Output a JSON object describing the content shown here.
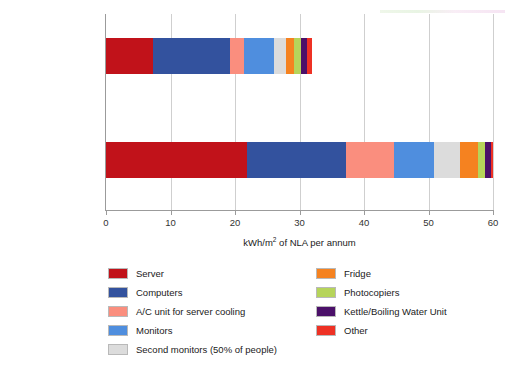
{
  "chart_data": {
    "type": "bar",
    "orientation": "horizontal",
    "stacked": true,
    "title": "",
    "xlabel": "kWh/m2 of NLA per annum",
    "xlabel_parts": {
      "pre": "kWh/m",
      "sup": "2",
      "post": " of NLA per annum"
    },
    "ylabel": "",
    "categories": [
      "Working hours only",
      "Total hours"
    ],
    "xlim": [
      0,
      60
    ],
    "xticks": [
      0,
      10,
      20,
      30,
      40,
      50,
      60
    ],
    "xticklabels": [
      "0",
      "10",
      "20",
      "30",
      "40",
      "50",
      "60"
    ],
    "grid": true,
    "legend_position": "bottom",
    "series": [
      {
        "name": "Server",
        "color": "#c1121a",
        "values": [
          7.3,
          21.9
        ]
      },
      {
        "name": "Computers",
        "color": "#33529e",
        "values": [
          11.9,
          15.3
        ]
      },
      {
        "name": "A/C unit for server cooling",
        "color": "#fa8e7e",
        "values": [
          2.2,
          7.5
        ]
      },
      {
        "name": "Monitors",
        "color": "#4f8ede",
        "values": [
          4.6,
          6.2
        ]
      },
      {
        "name": "Second monitors (50% of people)",
        "color": "#dcdcdc",
        "values": [
          1.9,
          4.0
        ]
      },
      {
        "name": "Fridge",
        "color": "#f58220",
        "values": [
          1.2,
          2.8
        ]
      },
      {
        "name": "Photocopiers",
        "color": "#b6d45a",
        "values": [
          1.1,
          1.1
        ]
      },
      {
        "name": "Kettle/Boiling Water Unit",
        "color": "#4b1069",
        "values": [
          1.0,
          0.9
        ]
      },
      {
        "name": "Other",
        "color": "#ee3124",
        "values": [
          0.7,
          0.3
        ]
      }
    ],
    "totals": [
      31.9,
      60.0
    ]
  },
  "legend": {
    "left_column": [
      {
        "label": "Server",
        "color": "#c1121a"
      },
      {
        "label": "Computers",
        "color": "#33529e"
      },
      {
        "label": "A/C unit for server cooling",
        "color": "#fa8e7e"
      },
      {
        "label": "Monitors",
        "color": "#4f8ede"
      },
      {
        "label": "Second monitors (50% of people)",
        "color": "#dcdcdc"
      }
    ],
    "right_column": [
      {
        "label": "Fridge",
        "color": "#f58220"
      },
      {
        "label": "Photocopiers",
        "color": "#b6d45a"
      },
      {
        "label": "Kettle/Boiling Water Unit",
        "color": "#4b1069"
      },
      {
        "label": "Other",
        "color": "#ee3124"
      }
    ]
  }
}
